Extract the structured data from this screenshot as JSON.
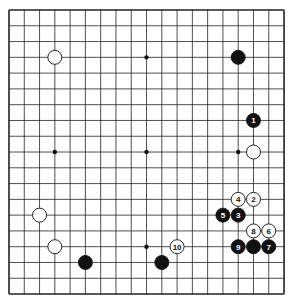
{
  "board": {
    "size": 19,
    "origin_x": 9,
    "origin_y": 10,
    "step_x": 15.28,
    "step_y": 15.78,
    "line_color": "#222222",
    "background": "#ffffff"
  },
  "star_points": [
    [
      3,
      3
    ],
    [
      9,
      3
    ],
    [
      15,
      3
    ],
    [
      3,
      9
    ],
    [
      9,
      9
    ],
    [
      15,
      9
    ],
    [
      3,
      15
    ],
    [
      9,
      15
    ],
    [
      15,
      15
    ]
  ],
  "stones": [
    {
      "col": 3,
      "row": 3,
      "color": "white",
      "label": ""
    },
    {
      "col": 15,
      "row": 3,
      "color": "black",
      "label": ""
    },
    {
      "col": 16,
      "row": 7,
      "color": "black",
      "label": "1"
    },
    {
      "col": 16,
      "row": 9,
      "color": "white",
      "label": ""
    },
    {
      "col": 16,
      "row": 12,
      "color": "white",
      "label": "2"
    },
    {
      "col": 15,
      "row": 13,
      "color": "black",
      "label": "3"
    },
    {
      "col": 15,
      "row": 12,
      "color": "white",
      "label": "4"
    },
    {
      "col": 14,
      "row": 13,
      "color": "black",
      "label": "5"
    },
    {
      "col": 17,
      "row": 14,
      "color": "white",
      "label": "6"
    },
    {
      "col": 17,
      "row": 15,
      "color": "black",
      "label": "7"
    },
    {
      "col": 16,
      "row": 14,
      "color": "white",
      "label": "8"
    },
    {
      "col": 15,
      "row": 15,
      "color": "black",
      "label": "9"
    },
    {
      "col": 11,
      "row": 15,
      "color": "white",
      "label": "10"
    },
    {
      "col": 16,
      "row": 15,
      "color": "black",
      "label": ""
    },
    {
      "col": 2,
      "row": 13,
      "color": "white",
      "label": ""
    },
    {
      "col": 3,
      "row": 15,
      "color": "white",
      "label": ""
    },
    {
      "col": 5,
      "row": 16,
      "color": "black",
      "label": ""
    },
    {
      "col": 10,
      "row": 16,
      "color": "black",
      "label": ""
    }
  ]
}
